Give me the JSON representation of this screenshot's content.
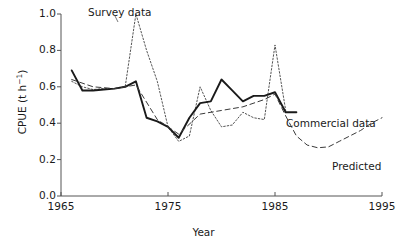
{
  "chart_data": {
    "type": "line",
    "title": "",
    "xlabel": "Year",
    "ylabel": "CPUE (t h⁻¹)",
    "ylabel_parts": {
      "prefix": "CPUE (t h",
      "exponent": "−1",
      "suffix": ")"
    },
    "xlim": [
      1965,
      1995
    ],
    "ylim": [
      0.0,
      1.0
    ],
    "grid": false,
    "legend_position": "inline-annotations",
    "xticks": [
      1965,
      1975,
      1985,
      1995
    ],
    "xtick_labels": [
      "1965",
      "1975",
      "1985",
      "1995"
    ],
    "yticks": [
      0.0,
      0.2,
      0.4,
      0.6,
      0.8,
      1.0
    ],
    "ytick_labels": [
      "0.0",
      "0.2",
      "0.4",
      "0.6",
      "0.8",
      "1.0"
    ],
    "series": [
      {
        "name": "Survey data",
        "style": "dotted",
        "color": "#555555",
        "x": [
          1966,
          1967,
          1968,
          1969,
          1970,
          1971,
          1972,
          1973,
          1974,
          1975,
          1976,
          1977,
          1978,
          1979,
          1980,
          1981,
          1982,
          1983,
          1984,
          1985,
          1986
        ],
        "y": [
          0.63,
          0.6,
          0.585,
          0.59,
          0.59,
          0.6,
          1.0,
          0.8,
          0.63,
          0.38,
          0.3,
          0.33,
          0.6,
          0.47,
          0.38,
          0.39,
          0.46,
          0.43,
          0.42,
          0.83,
          0.47
        ]
      },
      {
        "name": "Commercial data",
        "style": "solid",
        "color": "#1a1a1a",
        "x": [
          1966,
          1967,
          1968,
          1969,
          1970,
          1971,
          1972,
          1973,
          1974,
          1975,
          1976,
          1977,
          1978,
          1979,
          1980,
          1981,
          1982,
          1983,
          1984,
          1985,
          1986,
          1987
        ],
        "y": [
          0.69,
          0.58,
          0.58,
          0.585,
          0.59,
          0.6,
          0.63,
          0.43,
          0.41,
          0.38,
          0.32,
          0.43,
          0.51,
          0.52,
          0.64,
          0.58,
          0.52,
          0.55,
          0.55,
          0.57,
          0.46,
          0.46
        ]
      },
      {
        "name": "Predicted",
        "style": "dashed",
        "color": "#3a3a3a",
        "x": [
          1966,
          1968,
          1970,
          1972,
          1974,
          1976,
          1978,
          1980,
          1982,
          1984,
          1985,
          1986,
          1987,
          1988,
          1989,
          1990,
          1991,
          1992,
          1993,
          1994,
          1995
        ],
        "y": [
          0.64,
          0.6,
          0.59,
          0.61,
          0.42,
          0.34,
          0.45,
          0.47,
          0.49,
          0.53,
          0.56,
          0.44,
          0.33,
          0.28,
          0.265,
          0.27,
          0.3,
          0.33,
          0.36,
          0.4,
          0.43
        ]
      }
    ],
    "annotations": [
      {
        "text": "Survey data",
        "x": 1970.5,
        "y": 1.0
      },
      {
        "text": "Commercial data",
        "x": 1987.8,
        "y": 0.46
      },
      {
        "text": "Predicted",
        "x": 1991.5,
        "y": 0.3
      }
    ]
  },
  "colors": {
    "axis": "#555555",
    "text": "#1a1a1a",
    "background": "#ffffff"
  }
}
